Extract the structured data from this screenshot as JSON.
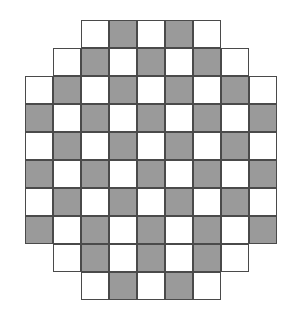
{
  "figure": {
    "name": "octagonal-checkerboard",
    "title": "",
    "background_color": "#ffffff",
    "canvas": {
      "width": 306,
      "height": 318
    }
  },
  "board": {
    "description": "Checkerboard pattern clipped to an octagonal (rounded-diamond) outline",
    "rows": 10,
    "columns": 9,
    "cell_width": 28,
    "cell_height": 28,
    "origin_x": 25,
    "origin_y": 20,
    "light_color": "#ffffff",
    "dark_color": "#9a9a9a",
    "border_color": "#4a4a4a",
    "border_width": 1.6,
    "row_spans": [
      {
        "row": 0,
        "start_col": 2,
        "end_col": 6,
        "count": 5
      },
      {
        "row": 1,
        "start_col": 1,
        "end_col": 7,
        "count": 7
      },
      {
        "row": 2,
        "start_col": 0,
        "end_col": 8,
        "count": 9
      },
      {
        "row": 3,
        "start_col": 0,
        "end_col": 8,
        "count": 9
      },
      {
        "row": 4,
        "start_col": 0,
        "end_col": 8,
        "count": 9
      },
      {
        "row": 5,
        "start_col": 0,
        "end_col": 8,
        "count": 9
      },
      {
        "row": 6,
        "start_col": 0,
        "end_col": 8,
        "count": 9
      },
      {
        "row": 7,
        "start_col": 0,
        "end_col": 8,
        "count": 9
      },
      {
        "row": 8,
        "start_col": 1,
        "end_col": 7,
        "count": 7
      },
      {
        "row": 9,
        "start_col": 2,
        "end_col": 6,
        "count": 5
      }
    ],
    "grid": [
      [
        "",
        "",
        "light",
        "dark",
        "light",
        "dark",
        "light",
        "",
        ""
      ],
      [
        "",
        "light",
        "dark",
        "light",
        "dark",
        "light",
        "dark",
        "light",
        ""
      ],
      [
        "light",
        "dark",
        "light",
        "dark",
        "light",
        "dark",
        "light",
        "dark",
        "light"
      ],
      [
        "dark",
        "light",
        "dark",
        "light",
        "dark",
        "light",
        "dark",
        "light",
        "dark"
      ],
      [
        "light",
        "dark",
        "light",
        "dark",
        "light",
        "dark",
        "light",
        "dark",
        "light"
      ],
      [
        "dark",
        "light",
        "dark",
        "light",
        "dark",
        "light",
        "dark",
        "light",
        "dark"
      ],
      [
        "light",
        "dark",
        "light",
        "dark",
        "light",
        "dark",
        "light",
        "dark",
        "light"
      ],
      [
        "dark",
        "light",
        "dark",
        "light",
        "dark",
        "light",
        "dark",
        "light",
        "dark"
      ],
      [
        "",
        "light",
        "dark",
        "light",
        "dark",
        "light",
        "dark",
        "light",
        ""
      ],
      [
        "",
        "",
        "light",
        "dark",
        "light",
        "dark",
        "light",
        "",
        ""
      ]
    ],
    "total_cells": 76,
    "light_cell_count": 40,
    "dark_cell_count": 36
  }
}
